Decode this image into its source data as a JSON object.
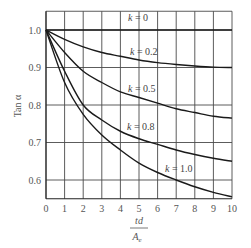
{
  "chart_data": {
    "type": "line",
    "title": "",
    "xlabel": "td / A_e",
    "xlabel_numerator": "td",
    "xlabel_denominator": "A",
    "xlabel_denominator_sub": "e",
    "ylabel": "Tan α",
    "xlim": [
      0,
      10
    ],
    "ylim": [
      0.55,
      1.05
    ],
    "grid": true,
    "x_ticks": [
      0,
      1,
      2,
      3,
      4,
      5,
      6,
      7,
      8,
      9,
      10
    ],
    "y_ticks": [
      0.6,
      0.7,
      0.8,
      0.9,
      1.0
    ],
    "y_tick_labels": [
      "0.6",
      "0.7",
      "0.8",
      "0.9",
      "1.0"
    ],
    "x": [
      0,
      1,
      2,
      3,
      4,
      5,
      6,
      7,
      8,
      9,
      10
    ],
    "series": [
      {
        "name": "k = 0",
        "k_value": "0",
        "values": [
          1.0,
          1.0,
          1.0,
          1.0,
          1.0,
          1.0,
          1.0,
          1.0,
          1.0,
          1.0,
          1.0
        ],
        "label_pos": [
          128,
          21
        ]
      },
      {
        "name": "k = 0.2",
        "k_value": "0.2",
        "values": [
          1.0,
          0.975,
          0.955,
          0.94,
          0.93,
          0.92,
          0.913,
          0.908,
          0.904,
          0.901,
          0.9
        ],
        "label_pos": [
          130,
          55
        ]
      },
      {
        "name": "k = 0.5",
        "k_value": "0.5",
        "values": [
          1.0,
          0.94,
          0.89,
          0.86,
          0.835,
          0.82,
          0.805,
          0.79,
          0.78,
          0.77,
          0.765
        ],
        "label_pos": [
          128,
          92
        ]
      },
      {
        "name": "k = 0.8",
        "k_value": "0.8",
        "values": [
          1.0,
          0.89,
          0.8,
          0.76,
          0.73,
          0.71,
          0.695,
          0.68,
          0.668,
          0.658,
          0.65
        ],
        "label_pos": [
          127,
          130
        ]
      },
      {
        "name": "k = 1.0",
        "k_value": "1.0",
        "values": [
          1.0,
          0.86,
          0.775,
          0.72,
          0.68,
          0.645,
          0.62,
          0.6,
          0.582,
          0.567,
          0.555
        ],
        "label_pos": [
          165,
          172
        ]
      }
    ],
    "legend": "inline labels beside curves"
  }
}
